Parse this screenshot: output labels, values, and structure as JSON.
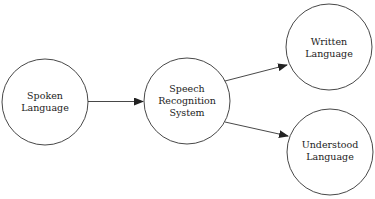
{
  "diagram": {
    "nodes": [
      {
        "id": "spoken",
        "lines": [
          "Spoken",
          "Language"
        ]
      },
      {
        "id": "speech",
        "lines": [
          "Speech",
          "Recognition",
          "System"
        ]
      },
      {
        "id": "written",
        "lines": [
          "Written",
          "Language"
        ]
      },
      {
        "id": "understood",
        "lines": [
          "Understood",
          "Language"
        ]
      }
    ],
    "edges": [
      {
        "from": "spoken",
        "to": "speech"
      },
      {
        "from": "speech",
        "to": "written"
      },
      {
        "from": "speech",
        "to": "understood"
      }
    ],
    "colors": {
      "stroke": "#333333",
      "background": "#ffffff",
      "text": "#222222"
    }
  }
}
